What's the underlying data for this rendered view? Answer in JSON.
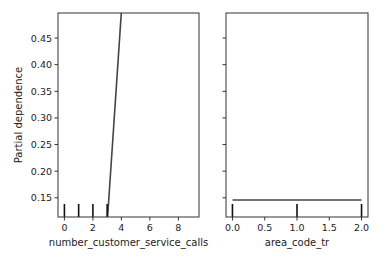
{
  "figure": {
    "ylabel": "Partial dependence",
    "colors": {
      "line": "#444444",
      "axes": "#333333",
      "text": "#222222",
      "background": "#ffffff"
    }
  },
  "chart_data": [
    {
      "type": "line",
      "title": "",
      "xlabel": "number_customer_service_calls",
      "ylabel": "Partial dependence",
      "xlim": [
        -0.45,
        9.45
      ],
      "ylim": [
        0.114,
        0.497
      ],
      "xticks": [
        0,
        2,
        4,
        6,
        8
      ],
      "xtick_labels": [
        "0",
        "2",
        "4",
        "6",
        "8"
      ],
      "yticks": [
        0.15,
        0.2,
        0.25,
        0.3,
        0.35,
        0.4,
        0.45
      ],
      "ytick_labels": [
        "0.15",
        "0.20",
        "0.25",
        "0.30",
        "0.35",
        "0.40",
        "0.45"
      ],
      "x": [
        0,
        1,
        2,
        3,
        4,
        5,
        6,
        7,
        8,
        9
      ],
      "values": [
        0.1,
        0.1,
        0.1,
        0.1,
        0.5,
        0.5,
        0.5,
        0.5,
        0.5,
        0.5
      ],
      "rug_marks": [
        0,
        1,
        2,
        3
      ],
      "grid": false,
      "legend": null
    },
    {
      "type": "line",
      "title": "",
      "xlabel": "area_code_tr",
      "ylabel": "",
      "xlim": [
        -0.1,
        2.1
      ],
      "ylim": [
        0.114,
        0.497
      ],
      "xticks": [
        0.0,
        0.5,
        1.0,
        1.5,
        2.0
      ],
      "xtick_labels": [
        "0.0",
        "0.5",
        "1.0",
        "1.5",
        "2.0"
      ],
      "yticks": [
        0.15,
        0.2,
        0.25,
        0.3,
        0.35,
        0.4,
        0.45
      ],
      "ytick_labels": [],
      "x": [
        0.0,
        2.0
      ],
      "values": [
        0.146,
        0.146
      ],
      "rug_marks": [
        0.0,
        1.0,
        2.0
      ],
      "grid": false,
      "legend": null
    }
  ]
}
